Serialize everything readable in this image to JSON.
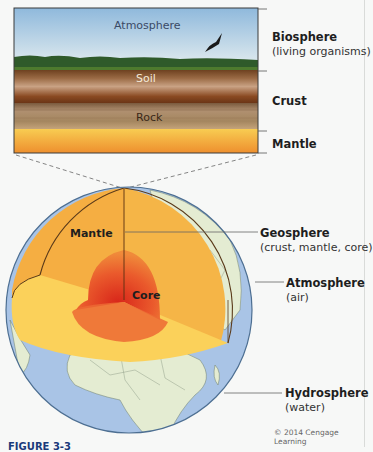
{
  "cross_section": {
    "atmosphere_label": "Atmosphere",
    "soil_label": "Soil",
    "rock_label": "Rock",
    "colors": {
      "sky_top": "#9cc2e0",
      "sky_bottom": "#dce8ee",
      "vegetation": "#2f5a2a",
      "soil_dark": "#6a3a1c",
      "soil_light": "#c49a78",
      "rock": "#a88a66",
      "mantle_top": "#f7c54a",
      "mantle_bottom": "#ee9030"
    }
  },
  "side_labels": {
    "biosphere": {
      "title": "Biosphere",
      "subtitle": "(living organisms)"
    },
    "crust": {
      "title": "Crust"
    },
    "mantle": {
      "title": "Mantle"
    }
  },
  "globe": {
    "mantle_label": "Mantle",
    "core_label": "Core",
    "colors": {
      "ocean": "#a9c4e6",
      "land": "#e4ecd2",
      "mantle": "#f5b547",
      "mantle_top_face": "#fbd15a",
      "core": "#e8442a"
    }
  },
  "callouts": {
    "geosphere": {
      "title": "Geosphere",
      "subtitle": "(crust, mantle, core)"
    },
    "atmosphere": {
      "title": "Atmosphere",
      "subtitle": "(air)"
    },
    "hydrosphere": {
      "title": "Hydrosphere",
      "subtitle": "(water)"
    }
  },
  "credit": "© 2014 Cengage Learning",
  "caption_partial": "FIGURE 3-3"
}
